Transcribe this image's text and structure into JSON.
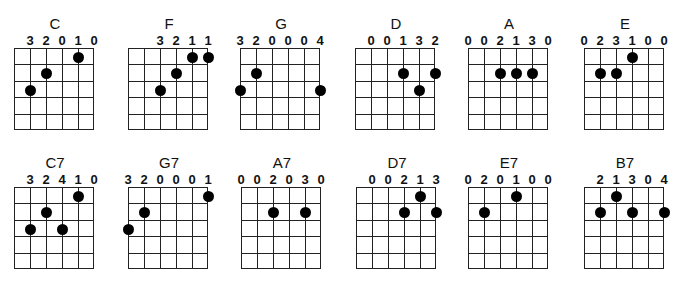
{
  "layout": {
    "string_spacing": 16,
    "fret_spacing": 16.4,
    "strings": 6,
    "frets": 5
  },
  "chords": [
    {
      "name": "C",
      "x": 14,
      "y": 16,
      "fingering": [
        "3",
        "2",
        "0",
        "1",
        "0"
      ],
      "label_strings": [
        1,
        2,
        3,
        4,
        5
      ],
      "dots": [
        {
          "string": 1,
          "fret": 3
        },
        {
          "string": 2,
          "fret": 2
        },
        {
          "string": 4,
          "fret": 1
        }
      ]
    },
    {
      "name": "F",
      "x": 128,
      "y": 16,
      "fingering": [
        "3",
        "2",
        "1",
        "1"
      ],
      "label_strings": [
        2,
        3,
        4,
        5
      ],
      "dots": [
        {
          "string": 2,
          "fret": 3
        },
        {
          "string": 3,
          "fret": 2
        },
        {
          "string": 4,
          "fret": 1
        },
        {
          "string": 5,
          "fret": 1
        }
      ]
    },
    {
      "name": "G",
      "x": 240,
      "y": 16,
      "fingering": [
        "3",
        "2",
        "0",
        "0",
        "0",
        "4"
      ],
      "label_strings": [
        0,
        1,
        2,
        3,
        4,
        5
      ],
      "dots": [
        {
          "string": 0,
          "fret": 3
        },
        {
          "string": 1,
          "fret": 2
        },
        {
          "string": 5,
          "fret": 3
        }
      ]
    },
    {
      "name": "D",
      "x": 355,
      "y": 16,
      "fingering": [
        "0",
        "0",
        "1",
        "3",
        "2"
      ],
      "label_strings": [
        1,
        2,
        3,
        4,
        5
      ],
      "dots": [
        {
          "string": 3,
          "fret": 2
        },
        {
          "string": 4,
          "fret": 3
        },
        {
          "string": 5,
          "fret": 2
        }
      ]
    },
    {
      "name": "A",
      "x": 468,
      "y": 16,
      "fingering": [
        "0",
        "0",
        "2",
        "1",
        "3",
        "0"
      ],
      "label_strings": [
        0,
        1,
        2,
        3,
        4,
        5
      ],
      "dots": [
        {
          "string": 2,
          "fret": 2
        },
        {
          "string": 3,
          "fret": 2
        },
        {
          "string": 4,
          "fret": 2
        }
      ]
    },
    {
      "name": "E",
      "x": 584,
      "y": 16,
      "fingering": [
        "0",
        "2",
        "3",
        "1",
        "0",
        "0"
      ],
      "label_strings": [
        0,
        1,
        2,
        3,
        4,
        5
      ],
      "dots": [
        {
          "string": 1,
          "fret": 2
        },
        {
          "string": 2,
          "fret": 2
        },
        {
          "string": 3,
          "fret": 1
        }
      ]
    },
    {
      "name": "C7",
      "x": 14,
      "y": 155,
      "fingering": [
        "3",
        "2",
        "4",
        "1",
        "0"
      ],
      "label_strings": [
        1,
        2,
        3,
        4,
        5
      ],
      "dots": [
        {
          "string": 1,
          "fret": 3
        },
        {
          "string": 2,
          "fret": 2
        },
        {
          "string": 3,
          "fret": 3
        },
        {
          "string": 4,
          "fret": 1
        }
      ]
    },
    {
      "name": "G7",
      "x": 128,
      "y": 155,
      "fingering": [
        "3",
        "2",
        "0",
        "0",
        "0",
        "1"
      ],
      "label_strings": [
        0,
        1,
        2,
        3,
        4,
        5
      ],
      "dots": [
        {
          "string": 0,
          "fret": 3
        },
        {
          "string": 1,
          "fret": 2
        },
        {
          "string": 5,
          "fret": 1
        }
      ]
    },
    {
      "name": "A7",
      "x": 241,
      "y": 155,
      "fingering": [
        "0",
        "0",
        "2",
        "0",
        "3",
        "0"
      ],
      "label_strings": [
        0,
        1,
        2,
        3,
        4,
        5
      ],
      "dots": [
        {
          "string": 2,
          "fret": 2
        },
        {
          "string": 4,
          "fret": 2
        }
      ]
    },
    {
      "name": "D7",
      "x": 356,
      "y": 155,
      "fingering": [
        "0",
        "0",
        "2",
        "1",
        "3"
      ],
      "label_strings": [
        1,
        2,
        3,
        4,
        5
      ],
      "dots": [
        {
          "string": 3,
          "fret": 2
        },
        {
          "string": 4,
          "fret": 1
        },
        {
          "string": 5,
          "fret": 2
        }
      ]
    },
    {
      "name": "E7",
      "x": 468,
      "y": 155,
      "fingering": [
        "0",
        "2",
        "0",
        "1",
        "0",
        "0"
      ],
      "label_strings": [
        0,
        1,
        2,
        3,
        4,
        5
      ],
      "dots": [
        {
          "string": 1,
          "fret": 2
        },
        {
          "string": 3,
          "fret": 1
        }
      ]
    },
    {
      "name": "B7",
      "x": 584,
      "y": 155,
      "fingering": [
        "2",
        "1",
        "3",
        "0",
        "4"
      ],
      "label_strings": [
        1,
        2,
        3,
        4,
        5
      ],
      "dots": [
        {
          "string": 1,
          "fret": 2
        },
        {
          "string": 2,
          "fret": 1
        },
        {
          "string": 3,
          "fret": 2
        },
        {
          "string": 5,
          "fret": 2
        }
      ]
    }
  ]
}
